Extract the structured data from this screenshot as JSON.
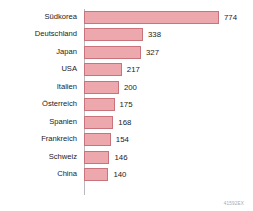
{
  "chart_data": {
    "type": "bar",
    "orientation": "horizontal",
    "title": "",
    "xlabel": "",
    "ylabel": "",
    "categories": [
      "Südkorea",
      "Deutschland",
      "Japan",
      "USA",
      "Italien",
      "Österreich",
      "Spanien",
      "Frankreich",
      "Schweiz",
      "China"
    ],
    "values": [
      774,
      338,
      327,
      217,
      200,
      175,
      168,
      154,
      146,
      140
    ],
    "value_labels": [
      "774",
      "338",
      "327",
      "217",
      "200",
      "175",
      "168",
      "154",
      "146",
      "140"
    ],
    "xlim": [
      0,
      774
    ],
    "grid": false,
    "legend": false,
    "bar_color": "#eda8ad",
    "bar_border_color": "#c9737c",
    "axis_color": "#b9b9bd",
    "text_color": "#1b1b1b"
  },
  "footer": {
    "reference_code": "41592EX"
  }
}
